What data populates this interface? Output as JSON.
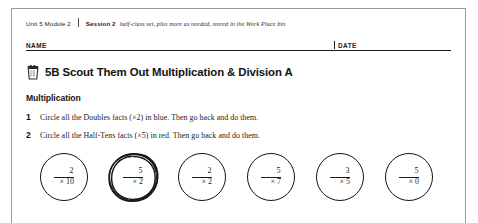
{
  "header": {
    "unit_module": "Unit 5  Module 2",
    "session_label": "Session 2",
    "session_note": "half-class set, plus more as needed, stored in the Work Place bin",
    "name_label": "NAME",
    "date_label": "DATE"
  },
  "title": {
    "icon": "work-place-bin-icon",
    "text": "5B Scout Them Out Multiplication & Division A"
  },
  "section": {
    "heading": "Multiplication"
  },
  "instructions": [
    {
      "number": "1",
      "text": "Circle all the Doubles facts (×2) in blue. Then go back and do them."
    },
    {
      "number": "2",
      "text": "Circle all the Half-Tens facts (×5) in red. Then go back and do them."
    }
  ],
  "problems": [
    {
      "top": "2",
      "bottom": "× 10",
      "circled": false
    },
    {
      "top": "5",
      "bottom": "× 2",
      "circled": true
    },
    {
      "top": "2",
      "bottom": "× 2",
      "circled": false
    },
    {
      "top": "5",
      "bottom": "× 7",
      "circled": false
    },
    {
      "top": "3",
      "bottom": "× 5",
      "circled": false
    },
    {
      "top": "5",
      "bottom": "× 0",
      "circled": false
    }
  ],
  "colors": {
    "ink": "#1a1a1a",
    "rule": "#1c1c1c",
    "page_border": "#9a9a9a"
  }
}
